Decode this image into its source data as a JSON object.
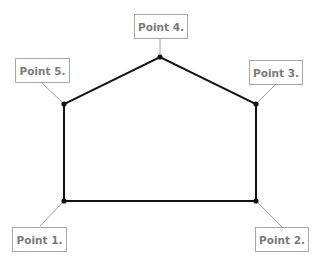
{
  "diagram": {
    "shape": "pentagon (house shape)",
    "points": [
      {
        "id": 1,
        "label": "Point 1.",
        "x": 64,
        "y": 201
      },
      {
        "id": 2,
        "label": "Point 2.",
        "x": 256,
        "y": 201
      },
      {
        "id": 3,
        "label": "Point 3.",
        "x": 256,
        "y": 104
      },
      {
        "id": 4,
        "label": "Point 4.",
        "x": 160,
        "y": 57
      },
      {
        "id": 5,
        "label": "Point 5.",
        "x": 64,
        "y": 104
      }
    ],
    "colors": {
      "edge": "#111111",
      "leader": "#a0a0a0",
      "label_text": "#7a7a7a",
      "label_border": "#a8a8a8"
    }
  }
}
